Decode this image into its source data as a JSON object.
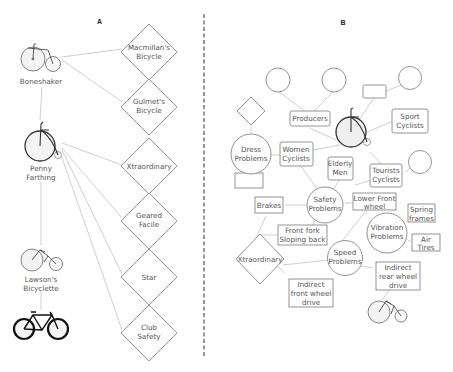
{
  "panel_a": {
    "label": "A",
    "bicycles": [
      {
        "name": "Boneshaker"
      },
      {
        "name_line1": "Penny",
        "name_line2": "Farthing"
      },
      {
        "name_line1": "Lawson's",
        "name_line2": "Bicyclette"
      },
      {
        "name": ""
      }
    ],
    "artifacts": [
      {
        "line1": "Macmillan's",
        "line2": "Bicycle"
      },
      {
        "line1": "Gulmet's",
        "line2": "Bicycle"
      },
      {
        "line1": "Xtraordinary",
        "line2": ""
      },
      {
        "line1": "Geared",
        "line2": "Facile"
      },
      {
        "line1": "Star",
        "line2": ""
      },
      {
        "line1": "Club",
        "line2": "Safety"
      }
    ]
  },
  "panel_b": {
    "label": "B",
    "groups": {
      "producers": "Producers",
      "sport_cyclists": {
        "line1": "Sport",
        "line2": "Cyclists"
      },
      "women_cyclists": {
        "line1": "Women",
        "line2": "Cyclists"
      },
      "elderly_men": {
        "line1": "Elderly",
        "line2": "Men"
      },
      "tourists_cyclists": {
        "line1": "Tourists",
        "line2": "Cyclists"
      }
    },
    "problems": {
      "dress": {
        "line1": "Dress",
        "line2": "Problems"
      },
      "safety": {
        "line1": "Safety",
        "line2": "Problems"
      },
      "vibration": {
        "line1": "Vibration",
        "line2": "Problems"
      },
      "speed": {
        "line1": "Speed",
        "line2": "Problems"
      }
    },
    "solutions": {
      "brakes": "Brakes",
      "lower_front_wheel": {
        "line1": "Lower Front",
        "line2": "wheel"
      },
      "front_fork": {
        "line1": "Front fork",
        "line2": "Sloping back"
      },
      "spring_frames": {
        "line1": "Spring",
        "line2": "frames"
      },
      "air_tires": {
        "line1": "Air",
        "line2": "Tires"
      },
      "indirect_rear": {
        "line1": "Indirect",
        "line2": "rear wheel",
        "line3": "drive"
      },
      "indirect_front": {
        "line1": "Indirect",
        "line2": "front wheel",
        "line3": "drive"
      }
    },
    "artifacts": {
      "xtraordinary": "Xtraordinary"
    }
  },
  "colors": {
    "edge": "#cfcfcf",
    "shape_stroke": "#888888",
    "divider": "#333333",
    "text": "#555555"
  }
}
